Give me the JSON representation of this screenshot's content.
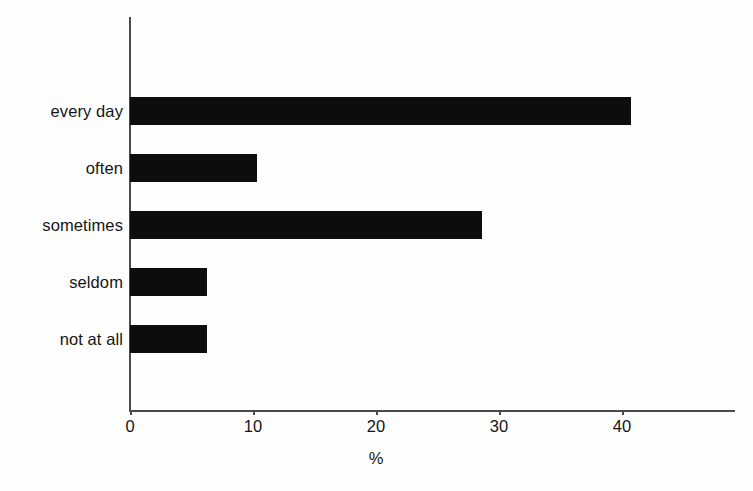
{
  "chart_data": {
    "type": "bar",
    "orientation": "horizontal",
    "title": "",
    "xlabel": "%",
    "ylabel": "",
    "categories": [
      "every day",
      "often",
      "sometimes",
      "seldom",
      "not at all"
    ],
    "values": [
      40.7,
      10.3,
      28.6,
      6.3,
      6.3
    ],
    "xlim": [
      0,
      49
    ],
    "xticks": [
      0,
      10,
      20,
      30,
      40
    ],
    "xtick_labels": [
      "0",
      "10",
      "20",
      "30",
      "40"
    ],
    "grid": false,
    "legend": false,
    "bar_color": "#0d0d0d",
    "axis_color": "#4a4a4a",
    "background_color": "#fefefe"
  },
  "axis": {
    "x_title": "%"
  }
}
